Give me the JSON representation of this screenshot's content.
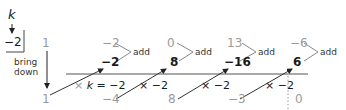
{
  "divisor": {
    "label": "k",
    "value": "−2"
  },
  "bring_down_label_1": "bring",
  "bring_down_label_2": "down",
  "coefficients": [
    "1",
    "−2",
    "0",
    "13",
    "−6"
  ],
  "products": [
    "−2",
    "8",
    "−16",
    "6"
  ],
  "results": [
    "1",
    "−4",
    "8",
    "−3",
    "0"
  ],
  "add_label": "add",
  "multiply_first": {
    "times": "×",
    "k": "k",
    "eq": "= −2"
  },
  "multiply_labels": [
    "× −2",
    "× −2",
    "× −2"
  ],
  "colors": {
    "gray": "#9a9a9a",
    "black": "#1a1a1a",
    "line": "#555555"
  }
}
